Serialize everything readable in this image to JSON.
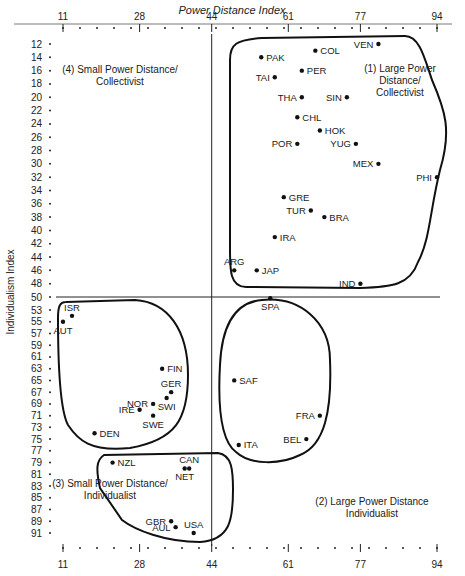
{
  "chart_data": {
    "type": "scatter",
    "title": "Power Distance Index",
    "xlabel": "Power Distance Index",
    "ylabel": "Individualism Index",
    "x_ticks": [
      11,
      28,
      44,
      61,
      77,
      94
    ],
    "y_ticks_upper": [
      12,
      14,
      16,
      18,
      20,
      22,
      24,
      26,
      28,
      30,
      32,
      34,
      36,
      38,
      40,
      42,
      44,
      46,
      48,
      50
    ],
    "y_ticks_lower": [
      53,
      55,
      57,
      59,
      61,
      63,
      65,
      67,
      69,
      71,
      73,
      75,
      77,
      79,
      81,
      83,
      85,
      87,
      89,
      91
    ],
    "xlim": [
      11,
      94
    ],
    "ylim_note": "Individualism index plotted as rank-scaled axis, 12 at top to 91 at bottom",
    "divider_x": 44,
    "divider_y": 50,
    "quadrant_labels": [
      {
        "id": 1,
        "lines": [
          "(1) Large Power",
          "Distance/",
          "Collectivist"
        ]
      },
      {
        "id": 2,
        "lines": [
          "(2) Large Power Distance",
          "Individualist"
        ]
      },
      {
        "id": 3,
        "lines": [
          "(3) Small Power Distance/",
          "Individualist"
        ]
      },
      {
        "id": 4,
        "lines": [
          "(4) Small Power Distance/",
          "Collectivist"
        ]
      }
    ],
    "points": [
      {
        "label": "PAK",
        "x": 55,
        "y": 14
      },
      {
        "label": "COL",
        "x": 67,
        "y": 13
      },
      {
        "label": "VEN",
        "x": 81,
        "y": 12
      },
      {
        "label": "TAI",
        "x": 58,
        "y": 17
      },
      {
        "label": "PER",
        "x": 64,
        "y": 16
      },
      {
        "label": "SIN",
        "x": 74,
        "y": 20
      },
      {
        "label": "THA",
        "x": 64,
        "y": 20
      },
      {
        "label": "CHL",
        "x": 63,
        "y": 23
      },
      {
        "label": "HOK",
        "x": 68,
        "y": 25
      },
      {
        "label": "POR",
        "x": 63,
        "y": 27
      },
      {
        "label": "YUG",
        "x": 76,
        "y": 27
      },
      {
        "label": "MEX",
        "x": 81,
        "y": 30
      },
      {
        "label": "PHI",
        "x": 94,
        "y": 32
      },
      {
        "label": "GRE",
        "x": 60,
        "y": 35
      },
      {
        "label": "TUR",
        "x": 66,
        "y": 37
      },
      {
        "label": "BRA",
        "x": 69,
        "y": 38
      },
      {
        "label": "IRA",
        "x": 58,
        "y": 41
      },
      {
        "label": "ARG",
        "x": 49,
        "y": 46
      },
      {
        "label": "JAP",
        "x": 54,
        "y": 46
      },
      {
        "label": "IND",
        "x": 77,
        "y": 48
      },
      {
        "label": "SPA",
        "x": 57,
        "y": 51
      },
      {
        "label": "ISR",
        "x": 13,
        "y": 54
      },
      {
        "label": "AUT",
        "x": 11,
        "y": 55
      },
      {
        "label": "FIN",
        "x": 33,
        "y": 63
      },
      {
        "label": "GER",
        "x": 35,
        "y": 67
      },
      {
        "label": "NOR",
        "x": 31,
        "y": 69
      },
      {
        "label": "SWI",
        "x": 34,
        "y": 68
      },
      {
        "label": "IRE",
        "x": 28,
        "y": 70
      },
      {
        "label": "SWE",
        "x": 31,
        "y": 71
      },
      {
        "label": "DEN",
        "x": 18,
        "y": 74
      },
      {
        "label": "SAF",
        "x": 49,
        "y": 65
      },
      {
        "label": "FRA",
        "x": 68,
        "y": 71
      },
      {
        "label": "BEL",
        "x": 65,
        "y": 75
      },
      {
        "label": "ITA",
        "x": 50,
        "y": 76
      },
      {
        "label": "NZL",
        "x": 22,
        "y": 79
      },
      {
        "label": "CAN",
        "x": 39,
        "y": 80
      },
      {
        "label": "NET",
        "x": 38,
        "y": 80
      },
      {
        "label": "GBR",
        "x": 35,
        "y": 89
      },
      {
        "label": "AUL",
        "x": 36,
        "y": 90
      },
      {
        "label": "USA",
        "x": 40,
        "y": 91
      }
    ]
  }
}
